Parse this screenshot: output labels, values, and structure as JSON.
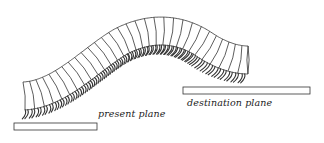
{
  "figure": {
    "type": "line-art diagram",
    "labels": {
      "present_plane": "present plane",
      "destination_plane": "destination plane"
    },
    "colors": {
      "background": "#ffffff",
      "stroke": "#333333",
      "text": "#222222"
    },
    "planes": [
      {
        "name": "present plane",
        "x": 14,
        "y": 123,
        "width": 83,
        "height": 7
      },
      {
        "name": "destination plane",
        "x": 183,
        "y": 87,
        "width": 127,
        "height": 7
      }
    ],
    "body": {
      "segment_count": 30,
      "start": {
        "x": 23,
        "top": 82,
        "bottom": 110
      },
      "peak": {
        "x": 150,
        "top": 16
      },
      "end": {
        "x": 248,
        "top": 45,
        "bottom": 75
      }
    }
  }
}
